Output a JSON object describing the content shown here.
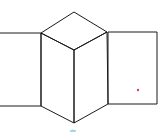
{
  "diagram": {
    "stroke_color": "#1a1a1a",
    "background": "#ffffff",
    "accent_dot_color": "#d9406a",
    "bottom_mark_color": "#9fd8ea",
    "shapes": {
      "left_rectangle": {
        "x1": 0,
        "y1": 33,
        "x2": 41,
        "y2": 106
      },
      "right_rectangle": {
        "x1": 108,
        "y1": 32,
        "x2": 157,
        "y2": 104
      },
      "top_rhombus": [
        [
          74,
          12
        ],
        [
          107,
          32
        ],
        [
          74,
          50
        ],
        [
          41,
          33
        ]
      ],
      "left_face": [
        [
          41,
          33
        ],
        [
          74,
          50
        ],
        [
          74,
          123
        ],
        [
          41,
          106
        ]
      ],
      "right_face": [
        [
          74,
          50
        ],
        [
          107,
          32
        ],
        [
          108,
          104
        ],
        [
          74,
          123
        ]
      ]
    },
    "dot": {
      "cx": 138,
      "cy": 90
    }
  }
}
